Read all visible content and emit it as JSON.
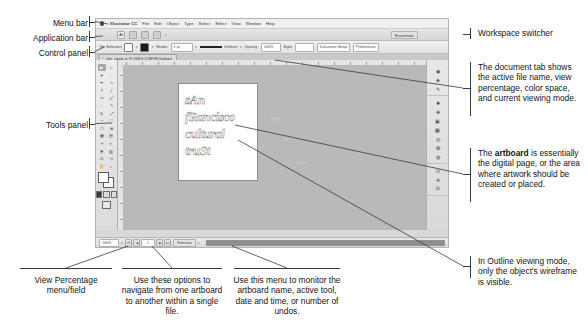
{
  "left_labels": [
    {
      "id": "menu-bar",
      "text": "Menu bar"
    },
    {
      "id": "application-bar",
      "text": "Application bar"
    },
    {
      "id": "control-panel",
      "text": "Control panel"
    },
    {
      "id": "tools-panel",
      "text": "Tools panel"
    }
  ],
  "right_annotations": [
    {
      "id": "workspace-switcher",
      "text": "Workspace switcher"
    },
    {
      "id": "document-tab",
      "text": "The document tab shows the active file name, view percentage, color space, and current viewing mode."
    },
    {
      "id": "artboard",
      "prefix": "The ",
      "bold": "artboard",
      "text": " is essentially the digital page, or the area where artwork should be created or placed."
    },
    {
      "id": "outline-mode",
      "text": "In Outline viewing mode, only the object's wireframe is visible."
    }
  ],
  "bottom_annotations": [
    {
      "id": "view-percentage",
      "text": "View Percentage menu/field"
    },
    {
      "id": "artboard-navigation",
      "text": "Use these options to navigate from one artboard to another within a single file."
    },
    {
      "id": "status-menu",
      "text": "Use this menu to monitor the artboard name, active tool, date and time, or number of undos."
    }
  ],
  "app": {
    "menu_bar": {
      "apple_icon": "apple-logo-icon",
      "items": [
        "Illustrator CC",
        "File",
        "Edit",
        "Object",
        "Type",
        "Select",
        "Effect",
        "View",
        "Window",
        "Help"
      ]
    },
    "application_bar": {
      "workspace_switcher": "Essentials",
      "buttons": [
        "bridge-icon",
        "stock-icon",
        "ai-icon",
        "arrange-documents-icon",
        "view-mode-icon",
        "screen-mode-icon",
        "search-icon"
      ]
    },
    "control_panel": {
      "selection_status": "No Selection",
      "stroke_label": "Stroke:",
      "stroke_weight": "1 pt",
      "brush_label": "Uniform",
      "style_label": "Style:",
      "opacity_label": "Opacity:",
      "opacity_value": "100%",
      "document_setup": "Document Setup",
      "preferences": "Preferences"
    },
    "document_tab": {
      "close_icon": "close-icon",
      "title": "sfct_stack.ai @ 100% (CMYK/Outline)"
    },
    "artwork": {
      "lines": [
        "sAn",
        "fRancisco",
        "cultural",
        "truSt"
      ]
    },
    "tools": {
      "items": [
        "selection-tool",
        "direct-selection-tool",
        "magic-wand-tool",
        "lasso-tool",
        "pen-tool",
        "curvature-tool",
        "type-tool",
        "line-segment-tool",
        "rectangle-tool",
        "paintbrush-tool",
        "shaper-tool",
        "pencil-tool",
        "rotate-tool",
        "scale-tool",
        "width-tool",
        "free-transform-tool",
        "shape-builder-tool",
        "perspective-grid-tool",
        "mesh-tool",
        "gradient-tool",
        "eyedropper-tool",
        "blend-tool",
        "symbol-sprayer-tool",
        "column-graph-tool",
        "artboard-tool",
        "slice-tool",
        "hand-tool",
        "zoom-tool"
      ],
      "fill_swatch": "fill-swatch",
      "stroke_swatch": "stroke-swatch",
      "color-mode": [
        "color-icon",
        "gradient-icon",
        "none-icon"
      ],
      "screen_mode": "screen-mode-icon"
    },
    "dock": {
      "groups": [
        [
          "color-panel-icon",
          "color-guide-icon",
          "brushes-panel-icon"
        ],
        [
          "symbols-panel-icon",
          "stroke-panel-icon",
          "gradient-panel-icon",
          "transparency-panel-icon",
          "appearance-panel-icon",
          "graphic-styles-icon",
          "layers-panel-icon"
        ],
        [
          "artboards-panel-icon",
          "libraries-panel-icon",
          "links-panel-icon"
        ]
      ]
    },
    "status_bar": {
      "zoom_value": "100%",
      "artboard_nav_first": "first-artboard-icon",
      "artboard_nav_prev": "previous-artboard-icon",
      "artboard_number": "1",
      "artboard_nav_next": "next-artboard-icon",
      "artboard_nav_last": "last-artboard-icon",
      "status_menu": "Selection",
      "scrollbar": "horizontal-scrollbar"
    }
  }
}
